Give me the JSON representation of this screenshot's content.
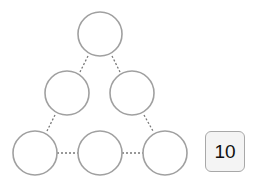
{
  "puzzle": {
    "type": "triangle-number-puzzle",
    "target_sum": "10",
    "nodes": [
      {
        "id": "top",
        "cx": 100,
        "cy": 34,
        "value": ""
      },
      {
        "id": "mid-left",
        "cx": 67,
        "cy": 93,
        "value": ""
      },
      {
        "id": "mid-right",
        "cx": 132,
        "cy": 93,
        "value": ""
      },
      {
        "id": "bottom-left",
        "cx": 35,
        "cy": 152,
        "value": ""
      },
      {
        "id": "bottom-middle",
        "cx": 100,
        "cy": 152,
        "value": ""
      },
      {
        "id": "bottom-right",
        "cx": 165,
        "cy": 152,
        "value": ""
      }
    ],
    "colors": {
      "circle_stroke": "#a0a0a0",
      "line": "#777777",
      "box_bg": "#f4f4f4"
    }
  }
}
